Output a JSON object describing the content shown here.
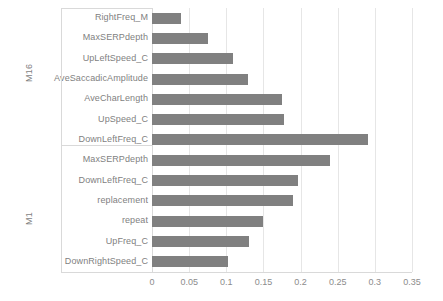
{
  "chart_data": {
    "type": "bar",
    "orientation": "horizontal",
    "title": "",
    "xlabel": "",
    "ylabel": "",
    "xlim": [
      0,
      0.35
    ],
    "xticks": [
      "0",
      "0.05",
      "0.1",
      "0.15",
      "0.2",
      "0.25",
      "0.3",
      "0.35"
    ],
    "xtick_values": [
      0,
      0.05,
      0.1,
      0.15,
      0.2,
      0.25,
      0.3,
      0.35
    ],
    "grid": "vertical",
    "legend": "none",
    "bar_color": "#808080",
    "groups": [
      {
        "name": "M16",
        "categories": [
          "RightFreq_M",
          "MaxSERPdepth",
          "UpLeftSpeed_C",
          "AveSaccadicAmplitude",
          "AveCharLength",
          "UpSpeed_C",
          "DownLeftFreq_C"
        ],
        "values": [
          0.039,
          0.076,
          0.109,
          0.129,
          0.175,
          0.178,
          0.291
        ]
      },
      {
        "name": "M1",
        "categories": [
          "MaxSERPdepth",
          "DownLeftFreq_C",
          "replacement",
          "repeat",
          "UpFreq_C",
          "DownRightSpeed_C"
        ],
        "values": [
          0.24,
          0.196,
          0.19,
          0.15,
          0.131,
          0.102
        ]
      }
    ],
    "categories": [
      "RightFreq_M",
      "MaxSERPdepth",
      "UpLeftSpeed_C",
      "AveSaccadicAmplitude",
      "AveCharLength",
      "UpSpeed_C",
      "DownLeftFreq_C",
      "MaxSERPdepth",
      "DownLeftFreq_C",
      "replacement",
      "repeat",
      "UpFreq_C",
      "DownRightSpeed_C"
    ],
    "values": [
      0.039,
      0.076,
      0.109,
      0.129,
      0.175,
      0.178,
      0.291,
      0.24,
      0.196,
      0.19,
      0.15,
      0.131,
      0.102
    ]
  },
  "axis": {
    "group_labels": [
      "M16",
      "M1"
    ]
  }
}
